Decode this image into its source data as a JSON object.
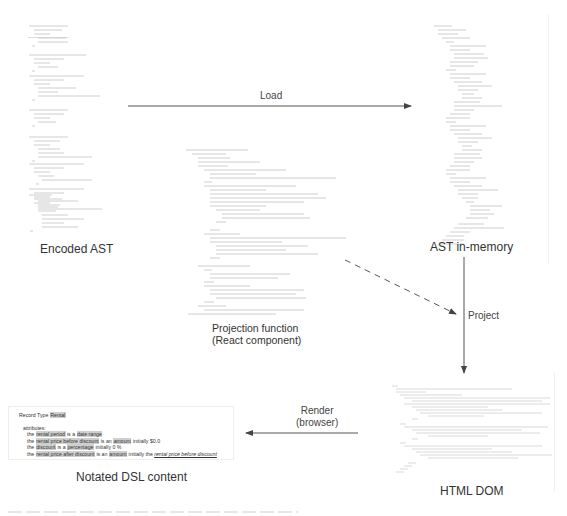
{
  "nodes": {
    "encoded_ast": {
      "label": "Encoded AST"
    },
    "projection_function": {
      "label_line1": "Projection function",
      "label_line2": "(React component)"
    },
    "ast_in_memory": {
      "label": "AST in-memory"
    },
    "html_dom": {
      "label": "HTML DOM"
    },
    "notated_dsl": {
      "label": "Notated DSL content"
    }
  },
  "edges": {
    "load": {
      "label": "Load"
    },
    "project": {
      "label": "Project"
    },
    "render": {
      "label_line1": "Render",
      "label_line2": "(browser)"
    }
  },
  "dsl": {
    "record_prefix": "Record Type",
    "record_name": "Rental",
    "attributes_label": "attributes:",
    "rows": [
      {
        "the": "the",
        "name": "rental period",
        "verb": "is a",
        "type": "date range",
        "initially": "",
        "value": ""
      },
      {
        "the": "the",
        "name": "rental price before discount",
        "verb": "is an",
        "type": "amount",
        "initially": "initially",
        "value": "$0.0"
      },
      {
        "the": "the",
        "name": "discount",
        "verb": "is a",
        "type": "percentage",
        "initially": "initially",
        "value": "0 %"
      },
      {
        "the": "the",
        "name": "rental price after discount",
        "verb": "is an",
        "type": "amount",
        "initially": "initially the",
        "value": "rental price before discount"
      }
    ]
  },
  "colors": {
    "arrow": "#444444",
    "highlight": "#cfcfcf",
    "code_text": "#999999"
  }
}
